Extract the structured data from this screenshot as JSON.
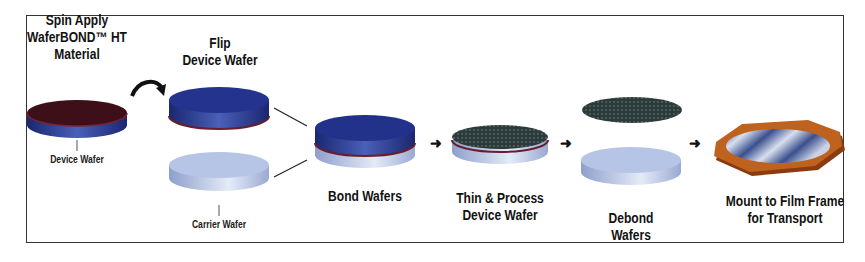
{
  "steps": {
    "spin": {
      "line1": "Spin Apply",
      "line2": "WaferBOND™ HT",
      "line3": "Material"
    },
    "flip": {
      "line1": "Flip",
      "line2": "Device Wafer"
    },
    "bond": {
      "line1": "Bond Wafers"
    },
    "thin": {
      "line1": "Thin & Process",
      "line2": "Device Wafer"
    },
    "debond": {
      "line1": "Debond",
      "line2": "Wafers"
    },
    "mount": {
      "line1": "Mount to Film Frame",
      "line2": "for Transport"
    }
  },
  "callouts": {
    "device_wafer": "Device Wafer",
    "carrier_wafer": "Carrier Wafer"
  },
  "colors": {
    "device_blue": "#1f2f86",
    "carrier_light": "#b9c6e6",
    "adhesive_red": "#5a1420",
    "processed_dark": "#2c3a3a",
    "film_frame_orange": "#b8581c"
  }
}
